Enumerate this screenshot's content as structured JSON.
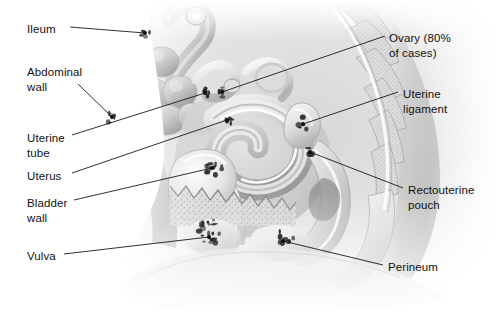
{
  "figure": {
    "type": "labeled-anatomical-diagram",
    "view": "midsagittal female pelvis",
    "background_color": "#ffffff",
    "line_color": "#1a1a1a",
    "text_color": "#111111",
    "marker_color": "#101010",
    "art_tone_light": "#f2f2f2",
    "art_tone_mid": "#b9b9b9",
    "art_tone_dark": "#6e6e6e",
    "lesion_color": "#2b2b2b"
  },
  "labels": [
    {
      "id": "ileum",
      "text": "Ileum",
      "lines": [
        "Ileum"
      ],
      "side": "left",
      "text_x": 27,
      "text_y": 22,
      "leader_start_x": 70,
      "leader_start_y": 27,
      "leader_end_x": 145,
      "leader_end_y": 33,
      "marker_x": 145,
      "marker_y": 33
    },
    {
      "id": "abdominal-wall",
      "text": "Abdominal wall",
      "lines": [
        "Abdominal",
        "wall"
      ],
      "side": "left",
      "text_x": 27,
      "text_y": 65,
      "leader_start_x": 78,
      "leader_start_y": 84,
      "leader_end_x": 112,
      "leader_end_y": 117,
      "marker_x": 112,
      "marker_y": 117
    },
    {
      "id": "uterine-tube",
      "text": "Uterine tube",
      "lines": [
        "Uterine",
        "tube"
      ],
      "side": "left",
      "text_x": 27,
      "text_y": 131,
      "leader_start_x": 72,
      "leader_start_y": 135,
      "leader_end_x": 205,
      "leader_end_y": 93,
      "marker_x": 205,
      "marker_y": 93
    },
    {
      "id": "uterus",
      "text": "Uterus",
      "lines": [
        "Uterus"
      ],
      "side": "left",
      "text_x": 27,
      "text_y": 169,
      "leader_start_x": 72,
      "leader_start_y": 173,
      "leader_end_x": 227,
      "leader_end_y": 120,
      "marker_x": 227,
      "marker_y": 120
    },
    {
      "id": "bladder-wall",
      "text": "Bladder wall",
      "lines": [
        "Bladder",
        "wall"
      ],
      "side": "left",
      "text_x": 27,
      "text_y": 196,
      "leader_start_x": 74,
      "leader_start_y": 200,
      "leader_end_x": 212,
      "leader_end_y": 168,
      "marker_x": 212,
      "marker_y": 168
    },
    {
      "id": "vulva",
      "text": "Vulva",
      "lines": [
        "Vulva"
      ],
      "side": "left",
      "text_x": 27,
      "text_y": 249,
      "leader_start_x": 64,
      "leader_start_y": 254,
      "leader_end_x": 209,
      "leader_end_y": 237,
      "marker_x": 209,
      "marker_y": 237
    },
    {
      "id": "ovary",
      "text": "Ovary (80% of cases)",
      "lines": [
        "Ovary (80%",
        "of cases)"
      ],
      "side": "right",
      "text_x": 389,
      "text_y": 31,
      "leader_start_x": 385,
      "leader_start_y": 36,
      "leader_end_x": 222,
      "leader_end_y": 92,
      "marker_x": 222,
      "marker_y": 92
    },
    {
      "id": "uterine-ligament",
      "text": "Uterine ligament",
      "lines": [
        "Uterine",
        "ligament"
      ],
      "side": "right",
      "text_x": 403,
      "text_y": 87,
      "leader_start_x": 398,
      "leader_start_y": 92,
      "leader_end_x": 303,
      "leader_end_y": 124,
      "marker_x": 303,
      "marker_y": 124
    },
    {
      "id": "rectouterine-pouch",
      "text": "Rectouterine pouch",
      "lines": [
        "Rectouterine",
        "pouch"
      ],
      "side": "right",
      "text_x": 408,
      "text_y": 183,
      "leader_start_x": 403,
      "leader_start_y": 188,
      "leader_end_x": 310,
      "leader_end_y": 152,
      "marker_x": 310,
      "marker_y": 152
    },
    {
      "id": "perineum",
      "text": "Perineum",
      "lines": [
        "Perineum"
      ],
      "side": "right",
      "text_x": 388,
      "text_y": 260,
      "leader_start_x": 383,
      "leader_start_y": 265,
      "leader_end_x": 283,
      "leader_end_y": 241,
      "marker_x": 283,
      "marker_y": 241
    }
  ],
  "lesions": [
    {
      "id": "lesion-ileum",
      "cx": 146,
      "cy": 33,
      "rx": 6,
      "ry": 5
    },
    {
      "id": "lesion-abdominal",
      "cx": 112,
      "cy": 117,
      "rx": 5,
      "ry": 9
    },
    {
      "id": "lesion-tube-left",
      "cx": 205,
      "cy": 93,
      "rx": 5,
      "ry": 5
    },
    {
      "id": "lesion-ovary",
      "cx": 222,
      "cy": 92,
      "rx": 5,
      "ry": 5
    },
    {
      "id": "lesion-uterus",
      "cx": 228,
      "cy": 121,
      "rx": 4,
      "ry": 4
    },
    {
      "id": "lesion-bladder",
      "cx": 212,
      "cy": 168,
      "rx": 14,
      "ry": 7
    },
    {
      "id": "lesion-ligament",
      "cx": 303,
      "cy": 124,
      "rx": 5,
      "ry": 7
    },
    {
      "id": "lesion-pouch",
      "cx": 310,
      "cy": 152,
      "rx": 5,
      "ry": 5
    },
    {
      "id": "lesion-vulva",
      "cx": 210,
      "cy": 232,
      "rx": 11,
      "ry": 13
    },
    {
      "id": "lesion-perineum",
      "cx": 285,
      "cy": 238,
      "rx": 10,
      "ry": 8
    }
  ]
}
